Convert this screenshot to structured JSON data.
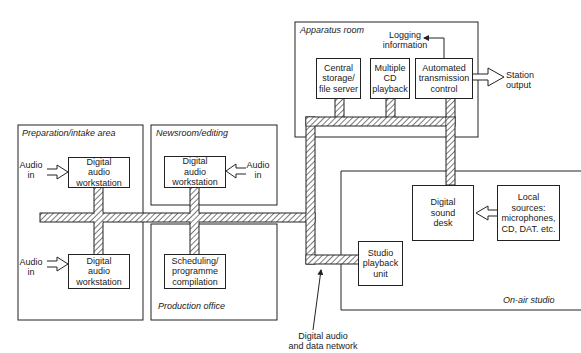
{
  "diagram": {
    "type": "block-diagram",
    "title": "",
    "areas": {
      "apparatus_room": "Apparatus room",
      "preparation": "Preparation/intake area",
      "newsroom": "Newsroom/editing",
      "production_office": "Production office",
      "on_air_studio": "On-air studio"
    },
    "blocks": {
      "central_storage": "Central\nstorage/\nfile server",
      "multiple_cd": "Multiple\nCD\nplayback",
      "atc": "Automated\ntransmission\ncontrol",
      "daw_prep_top": "Digital\naudio\nworkstation",
      "daw_prep_bottom": "Digital\naudio\nworkstation",
      "daw_news": "Digital\naudio\nworkstation",
      "scheduling": "Scheduling/\nprogramme\ncompilation",
      "sound_desk": "Digital\nsound\ndesk",
      "local_sources": "Local\nsources:\nmicrophones,\nCD, DAT. etc.",
      "studio_playback": "Studio\nplayback\nunit"
    },
    "labels": {
      "logging": "Logging\ninformation",
      "station_output": "Station\noutput",
      "audio_in_prep_top": "Audio\nin",
      "audio_in_prep_bottom": "Audio\nin",
      "audio_in_news": "Audio\nin",
      "network": "Digital audio\nand data network"
    },
    "colors": {
      "line": "#222222",
      "background": "#ffffff",
      "hatch": "#333333"
    }
  }
}
